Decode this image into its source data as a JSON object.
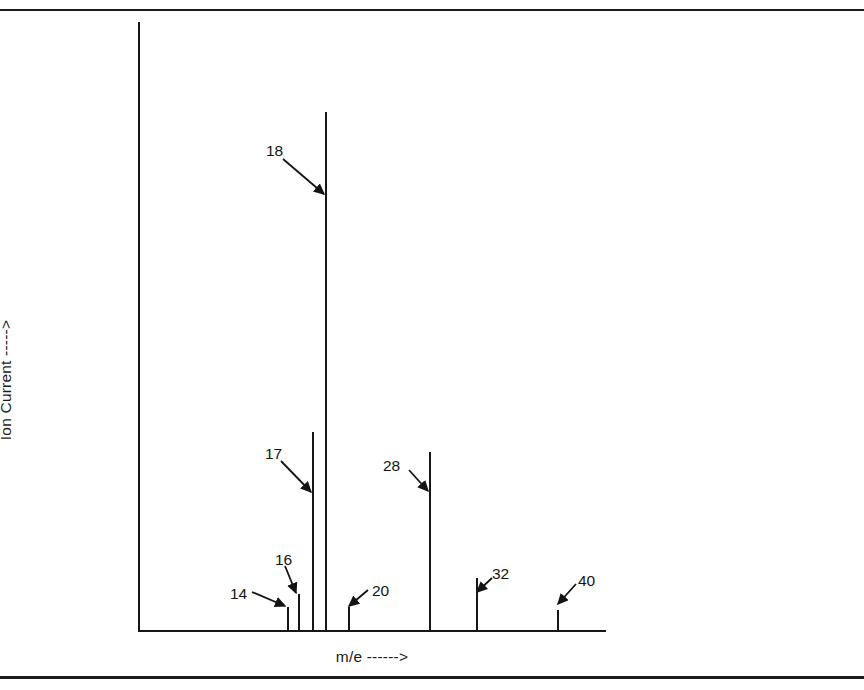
{
  "figure": {
    "background": "#ffffff",
    "ink_color": "#161616",
    "page_rules": [
      "top-rule",
      "bottom-rule"
    ]
  },
  "chart_data": {
    "type": "bar",
    "title": "",
    "subtitle": "",
    "xlabel": "m/e ------>",
    "ylabel": "Ion Current ----->",
    "grid": false,
    "legend": null,
    "xtick_labels": [],
    "ytick_labels": [],
    "axis_style": "two-spine (left and bottom), arrow-annotated axis titles, no tick marks",
    "categories": [
      "14",
      "16",
      "17",
      "18",
      "20",
      "28",
      "32",
      "40"
    ],
    "values": [
      4.4,
      6.9,
      38.2,
      100.0,
      4.4,
      34.4,
      10.0,
      3.9
    ],
    "ylim": [
      0,
      117.4
    ],
    "xlim": [
      10,
      48
    ],
    "units": {
      "x": "m/e",
      "y": "relative ion current"
    },
    "annotations": [
      {
        "label": "14",
        "points_to": "14",
        "label_x": 230,
        "label_y": 586,
        "arrow_from_x": 252,
        "arrow_from_y": 592,
        "arrow_to_x": 285,
        "arrow_to_y": 606
      },
      {
        "label": "16",
        "points_to": "16",
        "label_x": 275,
        "label_y": 552,
        "arrow_from_x": 285,
        "arrow_from_y": 566,
        "arrow_to_x": 296,
        "arrow_to_y": 593
      },
      {
        "label": "17",
        "points_to": "17",
        "label_x": 265,
        "label_y": 446,
        "arrow_from_x": 281,
        "arrow_from_y": 461,
        "arrow_to_x": 311,
        "arrow_to_y": 492
      },
      {
        "label": "18",
        "points_to": "18",
        "label_x": 266,
        "label_y": 143,
        "arrow_from_x": 283,
        "arrow_from_y": 159,
        "arrow_to_x": 324,
        "arrow_to_y": 194
      },
      {
        "label": "20",
        "points_to": "20",
        "label_x": 372,
        "label_y": 583,
        "arrow_from_x": 368,
        "arrow_from_y": 590,
        "arrow_to_x": 349,
        "arrow_to_y": 606
      },
      {
        "label": "28",
        "points_to": "28",
        "label_x": 383,
        "label_y": 458,
        "arrow_from_x": 409,
        "arrow_from_y": 470,
        "arrow_to_x": 428,
        "arrow_to_y": 491
      },
      {
        "label": "32",
        "points_to": "32",
        "label_x": 492,
        "label_y": 566,
        "arrow_from_x": 492,
        "arrow_from_y": 578,
        "arrow_to_x": 477,
        "arrow_to_y": 592
      },
      {
        "label": "40",
        "points_to": "40",
        "label_x": 578,
        "label_y": 573,
        "arrow_from_x": 576,
        "arrow_from_y": 584,
        "arrow_to_x": 558,
        "arrow_to_y": 604
      }
    ],
    "geometry": {
      "baseline_y": 630,
      "axis_x": 138,
      "axis_top_y": 22,
      "axis_right_x": 606,
      "peaks": [
        {
          "label": "14",
          "x": 287,
          "top_y": 607
        },
        {
          "label": "16",
          "x": 298,
          "top_y": 594
        },
        {
          "label": "17",
          "x": 312,
          "top_y": 432
        },
        {
          "label": "18",
          "x": 325,
          "top_y": 112
        },
        {
          "label": "20",
          "x": 348,
          "top_y": 607
        },
        {
          "label": "28",
          "x": 429,
          "top_y": 452
        },
        {
          "label": "32",
          "x": 476,
          "top_y": 578
        },
        {
          "label": "40",
          "x": 557,
          "top_y": 610
        }
      ]
    }
  }
}
